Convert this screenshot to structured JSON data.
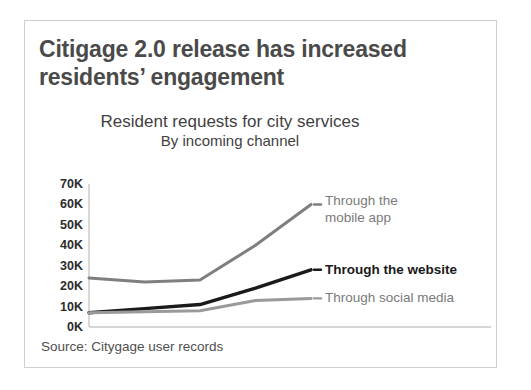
{
  "slide": {
    "title": "Citigage 2.0 release has increased residents’ engagement",
    "source_note": "Source: Citygage user records"
  },
  "chart_data": {
    "type": "line",
    "title": "Resident requests for city services",
    "subtitle": "By incoming channel",
    "xlabel": "",
    "ylabel": "",
    "categories": [
      "2016",
      "2017",
      "2018",
      "2019",
      "2020"
    ],
    "ytick_labels": [
      "0K",
      "10K",
      "20K",
      "30K",
      "40K",
      "50K",
      "60K",
      "70K"
    ],
    "ytick_values": [
      0,
      10000,
      20000,
      30000,
      40000,
      50000,
      60000,
      70000
    ],
    "ylim": [
      0,
      70000
    ],
    "grid": false,
    "legend_position": "right-inline",
    "series": [
      {
        "name": "Through the mobile app",
        "label_line1": "Through the",
        "label_line2": "mobile app",
        "color": "#7f7f7f",
        "emphasis": false,
        "values": [
          24000,
          22000,
          23000,
          40000,
          60000
        ]
      },
      {
        "name": "Through the website",
        "label_line1": "Through the website",
        "label_line2": "",
        "color": "#1a1a1a",
        "emphasis": true,
        "values": [
          7000,
          9000,
          11000,
          19000,
          28000
        ]
      },
      {
        "name": "Through social media",
        "label_line1": "Through social media",
        "label_line2": "",
        "color": "#9a9a9a",
        "emphasis": false,
        "values": [
          7000,
          7500,
          8000,
          13000,
          14000
        ]
      }
    ]
  },
  "colors": {
    "card_border": "#cfcfcf",
    "axis": "#c8c8c8",
    "title_text": "#4a4a4a"
  }
}
